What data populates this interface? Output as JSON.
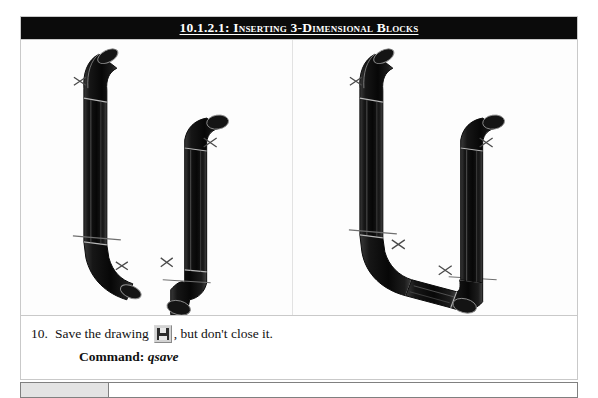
{
  "document": {
    "header": {
      "title": "10.1.2.1: Inserting 3-Dimensional Blocks",
      "background_color": "#0b0b0b",
      "text_color": "#ffffff"
    },
    "figure": {
      "caption_alt_left": "Two separate 3D pipe segments with elbow bends and X insertion markers",
      "caption_alt_right": "The two 3D pipe segments joined into a U-shaped assembly with X insertion markers",
      "panels": [
        {
          "name": "before",
          "label": ""
        },
        {
          "name": "after",
          "label": ""
        }
      ]
    },
    "step": {
      "number": "10.",
      "text_before_icon": "Save the drawing",
      "icon": "save-floppy-disk-icon",
      "text_after_icon": ", but don't close it."
    },
    "command": {
      "label": "Command:",
      "value": "qsave"
    },
    "next_table": {
      "left_cell": "",
      "right_cell": "",
      "left_cell_color": "#e3e3e3"
    }
  }
}
